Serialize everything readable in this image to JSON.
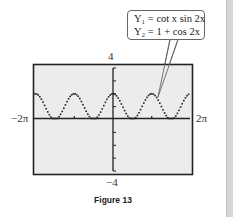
{
  "figure": {
    "caption": "Figure 13",
    "callout": {
      "line1": "Y₁ = cot x sin 2x",
      "line2": "Y₂ = 1 + cos 2x"
    },
    "window_labels": {
      "ymax": "4",
      "ymin": "−4",
      "xmin": "−2π",
      "xmax": "2π"
    }
  },
  "colors": {
    "screen_bg": "#ececec",
    "frame": "#222222",
    "curve": "#222222",
    "side_bar": "#d6d6d6"
  },
  "chart_data": {
    "type": "line",
    "title": "Figure 13",
    "series": [
      {
        "name": "Y1 = cot x sin 2x",
        "expression": "cot(x)*sin(2x)"
      },
      {
        "name": "Y2 = 1 + cos 2x",
        "expression": "1+cos(2x)"
      }
    ],
    "note": "Both graphs coincide (identity cot x sin 2x = 1 + cos 2x); displayed as dotted calculator plot",
    "x": [
      -6.283,
      -4.712,
      -3.142,
      -1.571,
      0,
      1.571,
      3.142,
      4.712,
      6.283
    ],
    "values": [
      2,
      0,
      2,
      0,
      2,
      0,
      2,
      0,
      2
    ],
    "xlabel": "",
    "ylabel": "",
    "xlim": [
      "-2π",
      "2π"
    ],
    "ylim": [
      -4,
      4
    ],
    "xticks": [
      "-2π",
      "2π"
    ],
    "yticks": [
      "-4",
      "4"
    ],
    "yscale_ticks": 1,
    "grid": false,
    "legend": "callout box, top right"
  }
}
